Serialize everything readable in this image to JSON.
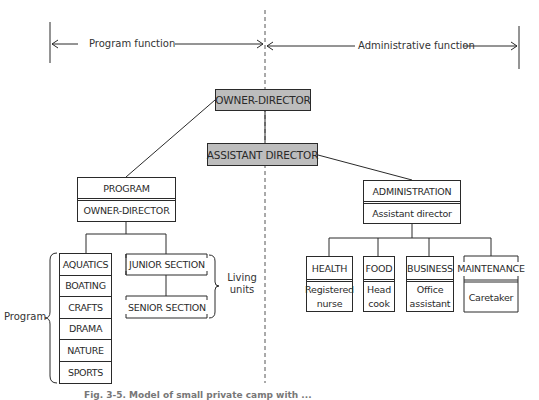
{
  "header": {
    "left_span_label": "Program function",
    "right_span_label": "Administrative function"
  },
  "top": {
    "owner_director": "OWNER-DIRECTOR",
    "assistant_director": "ASSISTANT DIRECTOR"
  },
  "program": {
    "title": "PROGRAM",
    "head": "OWNER-DIRECTOR",
    "group_label": "Program",
    "activities": [
      "AQUATICS",
      "BOATING",
      "CRAFTS",
      "DRAMA",
      "NATURE",
      "SPORTS"
    ],
    "living_units_label": "Living units",
    "living_units": [
      "JUNIOR SECTION",
      "SENIOR SECTION"
    ]
  },
  "administration": {
    "title": "ADMINISTRATION",
    "head": "Assistant director",
    "departments": [
      {
        "name": "HEALTH",
        "staff": "Registered nurse"
      },
      {
        "name": "FOOD",
        "staff": "Head cook"
      },
      {
        "name": "BUSINESS",
        "staff": "Office assistant"
      },
      {
        "name": "MAINTENANCE",
        "staff": "Caretaker"
      }
    ]
  },
  "caption": "Fig. 3-5. Model of small private camp with ...",
  "colors": {
    "line": "#2a2a2a",
    "shaded_box": "#bdbdbd"
  }
}
